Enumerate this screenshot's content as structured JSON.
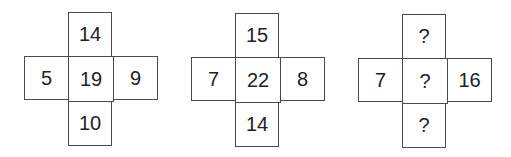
{
  "puzzle": {
    "figures": [
      {
        "top": "14",
        "left": "5",
        "center": "19",
        "right": "9",
        "bottom": "10"
      },
      {
        "top": "15",
        "left": "7",
        "center": "22",
        "right": "8",
        "bottom": "14"
      },
      {
        "top": "?",
        "left": "7",
        "center": "?",
        "right": "16",
        "bottom": "?"
      }
    ],
    "colors": {
      "border": "#4a4a4a",
      "text": "#222222",
      "background": "#ffffff"
    }
  }
}
